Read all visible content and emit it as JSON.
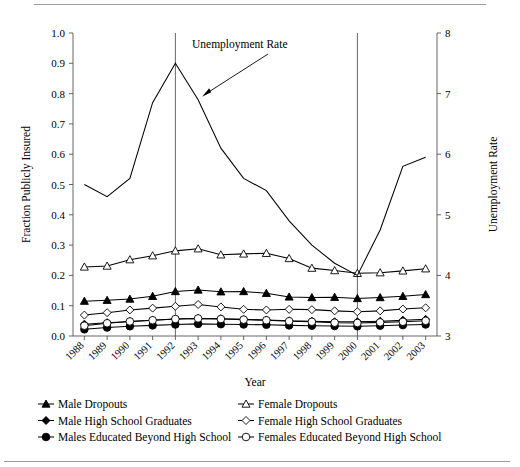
{
  "figure": {
    "x_axis_title": "Year",
    "y_left_title": "Fraction Publicly Insured",
    "y_right_title": "Unemployment Rate",
    "annotation": "Unemployment Rate"
  },
  "chart_data": {
    "type": "line",
    "title": "",
    "xlabel": "Year",
    "ylabel": "Fraction Publicly Insured",
    "y2label": "Unemployment Rate",
    "ylim": [
      0.0,
      1.0
    ],
    "y2lim": [
      3,
      8
    ],
    "grid": false,
    "legend_position": "below",
    "annotations": [
      {
        "text": "Unemployment Rate",
        "points_to_year": 1993,
        "points_to_value": 0.79
      }
    ],
    "vertical_reference_lines": [
      1992,
      2000
    ],
    "categories": [
      1988,
      1989,
      1990,
      1991,
      1992,
      1993,
      1994,
      1995,
      1996,
      1997,
      1998,
      1999,
      2000,
      2001,
      2002,
      2003
    ],
    "y_left_ticks": [
      0.0,
      0.1,
      0.2,
      0.3,
      0.4,
      0.5,
      0.6,
      0.7,
      0.8,
      0.9,
      1.0
    ],
    "y_right_ticks": [
      3,
      4,
      5,
      6,
      7,
      8
    ],
    "series": [
      {
        "name": "Male Dropouts",
        "marker": "filled-triangle",
        "axis": "left",
        "values": [
          0.115,
          0.118,
          0.122,
          0.131,
          0.147,
          0.152,
          0.146,
          0.147,
          0.141,
          0.129,
          0.127,
          0.128,
          0.124,
          0.127,
          0.131,
          0.137
        ]
      },
      {
        "name": "Male High School Graduates",
        "marker": "filled-diamond",
        "axis": "left",
        "values": [
          0.039,
          0.044,
          0.048,
          0.052,
          0.056,
          0.058,
          0.057,
          0.055,
          0.053,
          0.05,
          0.049,
          0.047,
          0.047,
          0.049,
          0.052,
          0.055
        ]
      },
      {
        "name": "Males Educated Beyond High School",
        "marker": "filled-circle",
        "axis": "left",
        "values": [
          0.022,
          0.028,
          0.032,
          0.035,
          0.038,
          0.04,
          0.039,
          0.038,
          0.037,
          0.035,
          0.034,
          0.033,
          0.032,
          0.034,
          0.036,
          0.038
        ]
      },
      {
        "name": "Female Dropouts",
        "marker": "open-triangle",
        "axis": "left",
        "values": [
          0.228,
          0.231,
          0.252,
          0.265,
          0.281,
          0.288,
          0.268,
          0.271,
          0.273,
          0.256,
          0.224,
          0.216,
          0.207,
          0.209,
          0.215,
          0.222
        ]
      },
      {
        "name": "Female High School Graduates",
        "marker": "open-diamond",
        "axis": "left",
        "values": [
          0.069,
          0.077,
          0.086,
          0.092,
          0.098,
          0.104,
          0.096,
          0.088,
          0.086,
          0.088,
          0.087,
          0.083,
          0.08,
          0.083,
          0.089,
          0.093
        ]
      },
      {
        "name": "Females Educated Beyond High School",
        "marker": "open-circle",
        "axis": "left",
        "values": [
          0.034,
          0.042,
          0.048,
          0.052,
          0.056,
          0.058,
          0.056,
          0.054,
          0.052,
          0.049,
          0.047,
          0.044,
          0.043,
          0.045,
          0.047,
          0.05
        ]
      },
      {
        "name": "Unemployment Rate",
        "marker": "none",
        "axis": "right",
        "values": [
          5.5,
          5.3,
          5.6,
          6.85,
          7.5,
          6.9,
          6.1,
          5.6,
          5.4,
          4.9,
          4.5,
          4.2,
          4.0,
          4.75,
          5.8,
          5.95
        ]
      }
    ]
  },
  "legend": {
    "left_column": [
      {
        "label": "Male Dropouts",
        "marker": "filled-triangle"
      },
      {
        "label": "Male High School Graduates",
        "marker": "filled-diamond"
      },
      {
        "label": "Males Educated Beyond High School",
        "marker": "filled-circle"
      }
    ],
    "right_column": [
      {
        "label": "Female Dropouts",
        "marker": "open-triangle"
      },
      {
        "label": "Female High School Graduates",
        "marker": "open-diamond"
      },
      {
        "label": "Females Educated Beyond High School",
        "marker": "open-circle"
      }
    ]
  }
}
